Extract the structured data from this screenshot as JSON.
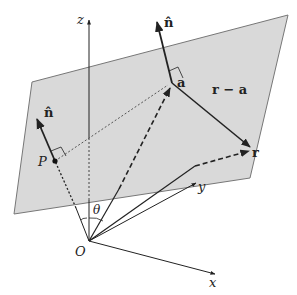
{
  "labels": {
    "z": "z",
    "x": "x",
    "y": "y",
    "O": "O",
    "theta": "θ",
    "P": "P",
    "n_hat_P": "n̂",
    "n_hat_a": "n̂",
    "a": "a",
    "r": "r",
    "r_minus_a": "r − a"
  },
  "colors": {
    "plane_fill": "#d9d9d9",
    "plane_stroke": "#777777",
    "line": "#222222"
  }
}
